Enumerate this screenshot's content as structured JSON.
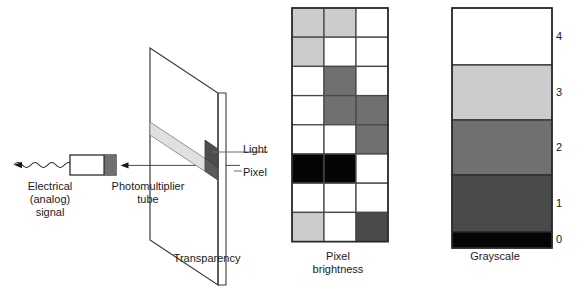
{
  "figure": {
    "labels": {
      "electrical_signal": "Electrical\n(analog)\nsignal",
      "electrical_signal_line1": "Electrical",
      "electrical_signal_line2": "(analog)",
      "electrical_signal_line3": "signal",
      "photomultiplier_line1": "Photomultiplier",
      "photomultiplier_line2": "tube",
      "transparency": "Transparency",
      "light": "Light",
      "pixel": "Pixel",
      "pixel_brightness_line1": "Pixel",
      "pixel_brightness_line2": "brightness",
      "grayscale": "Grayscale"
    },
    "colors": {
      "ink": "#1a1a1a",
      "stroke": "#3a3a3a",
      "background": "#ffffff",
      "light_gray": "#cccccc",
      "mid_gray": "#707070",
      "dark_gray": "#4a4a4a",
      "black": "#050505",
      "white": "#ffffff",
      "beam_strip": "#e0e0e0",
      "pixel_patch": "#5a5a5a",
      "tube_cap": "#707070"
    }
  },
  "chart_data": {
    "type": "heatmap",
    "title": "Pixel brightness",
    "xlabel": "",
    "ylabel": "",
    "columns": 3,
    "rows": 8,
    "grid": true,
    "legend": "Grayscale",
    "note": "3-column by 8-row pixel brightness map sampled from a transparency; each cell holds a grayscale level 0-4.",
    "level_colors": [
      "#050505",
      "#4a4a4a",
      "#707070",
      "#cccccc",
      "#ffffff"
    ],
    "values": [
      [
        3,
        3,
        4
      ],
      [
        3,
        4,
        4
      ],
      [
        4,
        2,
        4
      ],
      [
        4,
        2,
        2
      ],
      [
        4,
        4,
        2
      ],
      [
        0,
        0,
        4
      ],
      [
        4,
        4,
        4
      ],
      [
        3,
        4,
        1
      ]
    ],
    "grayscale_legend": {
      "type": "bar",
      "title": "Grayscale",
      "levels": [
        {
          "label": "4",
          "color": "#ffffff",
          "height_px": 57
        },
        {
          "label": "3",
          "color": "#cccccc",
          "height_px": 55
        },
        {
          "label": "2",
          "color": "#707070",
          "height_px": 55
        },
        {
          "label": "1",
          "color": "#4a4a4a",
          "height_px": 57
        },
        {
          "label": "0",
          "color": "#050505",
          "height_px": 16
        }
      ]
    }
  }
}
